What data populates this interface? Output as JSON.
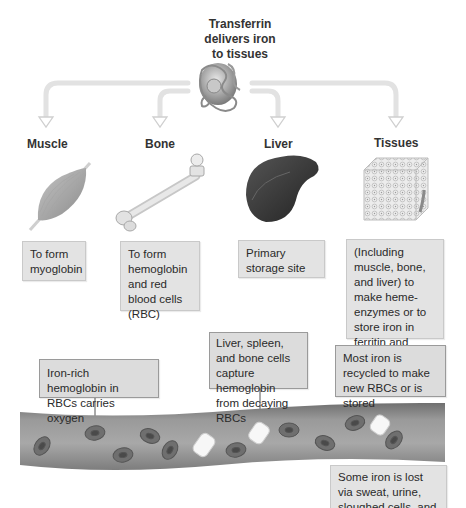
{
  "header": {
    "title_lines": [
      "Transferrin",
      "delivers iron",
      "to tissues"
    ]
  },
  "targets": [
    {
      "label": "Muscle",
      "description": "To form myoglobin"
    },
    {
      "label": "Bone",
      "description": "To form hemoglobin and red blood cells (RBC)"
    },
    {
      "label": "Liver",
      "description": "Primary storage site"
    },
    {
      "label": "Tissues",
      "description": "(Including muscle, bone, and liver) to make heme-enzymes or to store iron in ferritin and hemosiderin"
    }
  ],
  "bloodstream": {
    "callouts": [
      {
        "text": "Iron-rich hemoglobin in RBCs carries oxygen"
      },
      {
        "text": "Liver, spleen, and bone cells capture hemoglobin from decaying RBCs"
      },
      {
        "text": "Most iron is recycled to make new RBCs or is stored"
      },
      {
        "text": "Some iron is lost via sweat, urine, sloughed cells, and lost blood"
      }
    ]
  },
  "icons": [
    "transferrin-protein-icon",
    "muscle-icon",
    "bone-icon",
    "liver-icon",
    "tissue-block-icon",
    "blood-vessel-icon",
    "red-blood-cell-icon",
    "decaying-rbc-icon"
  ],
  "colors": {
    "arrow": "#e2e2e2",
    "box_fill": "#e3e3e3",
    "vessel": "#8f8f8f",
    "rbc": "#6e6e6e",
    "liver": "#3c3c3c"
  }
}
